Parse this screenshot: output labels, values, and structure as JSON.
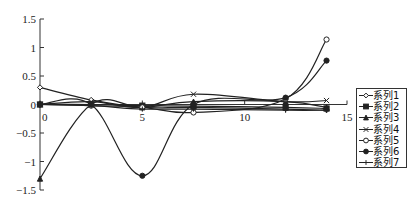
{
  "chart_data": {
    "type": "line",
    "title": "",
    "xlabel": "",
    "ylabel": "",
    "xlim": [
      0,
      15
    ],
    "ylim": [
      -1.5,
      1.5
    ],
    "x_ticks": [
      "0",
      "5",
      "10",
      "15"
    ],
    "y_ticks": [
      "1.5",
      "1",
      "0.5",
      "0",
      "-0.5",
      "-1",
      "-1.5"
    ],
    "grid": false,
    "legend_position": "right",
    "smooth": true,
    "x": [
      0,
      2.5,
      5,
      7.5,
      12,
      14
    ],
    "series": [
      {
        "name": "系列1",
        "marker": "diamond",
        "values": [
          0.3,
          0.08,
          -0.05,
          -0.05,
          -0.08,
          -0.1
        ]
      },
      {
        "name": "系列2",
        "marker": "square",
        "values": [
          0,
          0.0,
          -0.02,
          -0.03,
          -0.05,
          -0.07
        ]
      },
      {
        "name": "系列3",
        "marker": "triangle",
        "values": [
          -1.3,
          0.0,
          -0.05,
          0.05,
          0.05,
          -0.05
        ]
      },
      {
        "name": "系列4",
        "marker": "x",
        "values": [
          0,
          0.05,
          -0.05,
          0.18,
          0.05,
          0.07
        ]
      },
      {
        "name": "系列5",
        "marker": "open-circle",
        "values": [
          0,
          -0.02,
          -0.05,
          -0.14,
          0.1,
          1.14
        ]
      },
      {
        "name": "系列6",
        "marker": "filled-circle",
        "values": [
          0,
          0.0,
          -1.25,
          0.0,
          0.12,
          0.77
        ]
      },
      {
        "name": "系列7",
        "marker": "plus",
        "values": [
          0,
          -0.02,
          -0.08,
          -0.08,
          -0.1,
          -0.1
        ]
      }
    ]
  },
  "legend": {
    "items": [
      "系列1",
      "系列2",
      "系列3",
      "系列4",
      "系列5",
      "系列6",
      "系列7"
    ]
  },
  "colors": {
    "line": "#222222",
    "axis": "#333333"
  }
}
